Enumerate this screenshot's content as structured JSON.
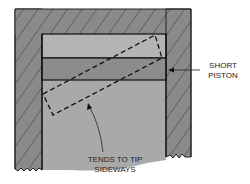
{
  "diagram": {
    "labels": {
      "short_piston": [
        "SHORT",
        "PISTON"
      ],
      "tends_to_tip": [
        "TENDS TO TIP",
        "SIDEWAYS"
      ]
    },
    "parts": {
      "cylinder_wall": "hatched cylinder wall",
      "piston_top": "piston top band",
      "piston_ring_band": "piston ring band",
      "cylinder_bore": "cylinder bore",
      "tipped_outline": "dashed outline of tipped piston"
    },
    "colors": {
      "wall": "#8a8a8a",
      "hatch": "#3a3a3a",
      "piston_top": "#b4b4b4",
      "ring_band": "#8c8c8c",
      "bore": "#a9a9a9",
      "outline": "#111111"
    }
  }
}
